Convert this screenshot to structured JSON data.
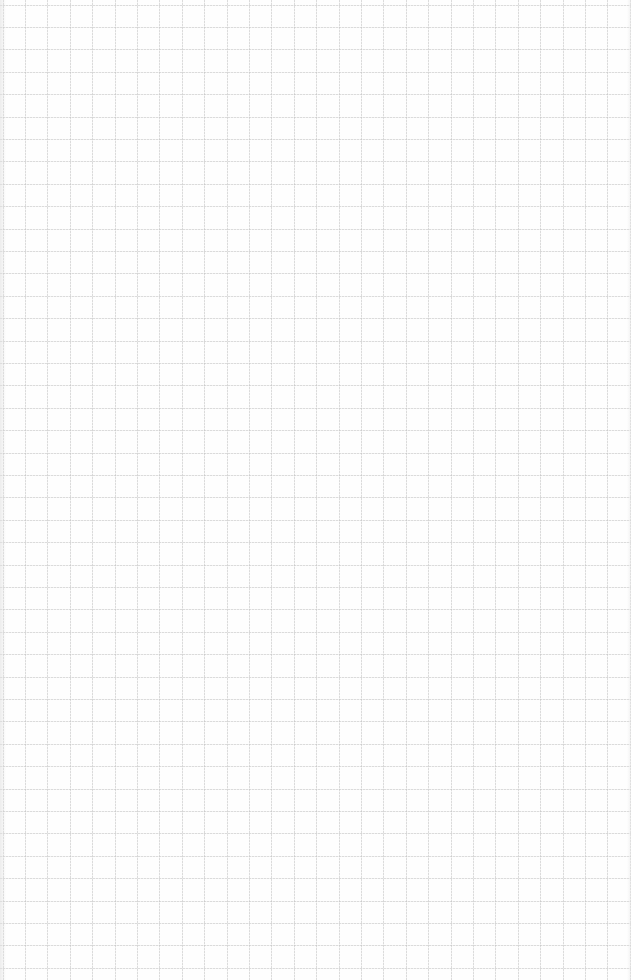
{
  "page": {
    "type": "graph-paper",
    "grid": {
      "cell_size_px": 22.4,
      "columns": 28,
      "rows": 43,
      "line_color": "#bebebe",
      "background_color": "#fefefe",
      "line_style": "dotted"
    },
    "content": []
  }
}
